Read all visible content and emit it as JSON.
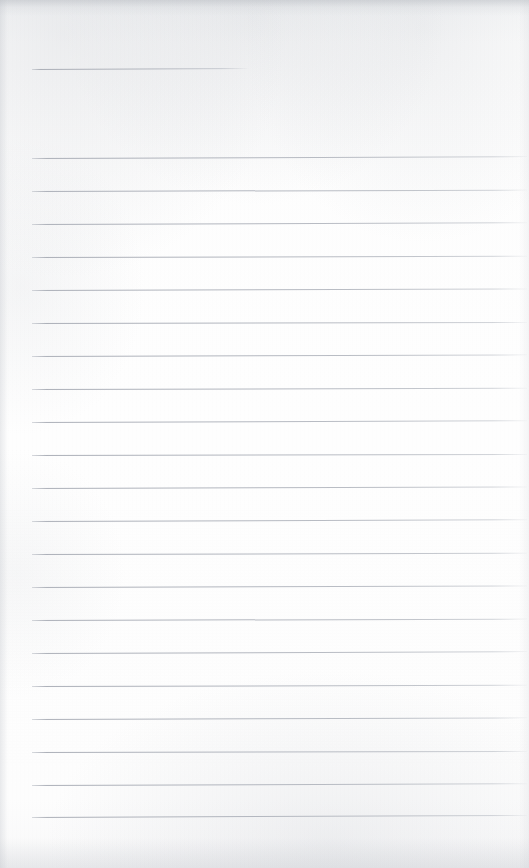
{
  "document": {
    "kind": "ruled-notebook-page",
    "title": "Blank Ruled Page",
    "content_text": "",
    "page_width": 529,
    "page_height": 868,
    "background_color": "#fdfdfd",
    "rule_color": "#aeb2bb",
    "rule_thickness_px": 1
  },
  "ruling": {
    "short_rule": {
      "label": "short-rule",
      "x_start": 32,
      "x_end": 248,
      "y": 69,
      "tilt_deg": -0.25
    },
    "body_rules": {
      "label": "body-rules",
      "count": 21,
      "x_start": 32,
      "x_end": 527,
      "first_y": 158,
      "spacing_px": 32.9,
      "lines": [
        {
          "index": 1,
          "y": 158,
          "tilt_deg": -0.22
        },
        {
          "index": 2,
          "y": 191,
          "tilt_deg": -0.16
        },
        {
          "index": 3,
          "y": 224,
          "tilt_deg": -0.2
        },
        {
          "index": 4,
          "y": 257,
          "tilt_deg": -0.14
        },
        {
          "index": 5,
          "y": 290,
          "tilt_deg": -0.18
        },
        {
          "index": 6,
          "y": 323,
          "tilt_deg": -0.12
        },
        {
          "index": 7,
          "y": 356,
          "tilt_deg": -0.19
        },
        {
          "index": 8,
          "y": 389,
          "tilt_deg": -0.15
        },
        {
          "index": 9,
          "y": 422,
          "tilt_deg": -0.21
        },
        {
          "index": 10,
          "y": 455,
          "tilt_deg": -0.13
        },
        {
          "index": 11,
          "y": 488,
          "tilt_deg": -0.17
        },
        {
          "index": 12,
          "y": 521,
          "tilt_deg": -0.2
        },
        {
          "index": 13,
          "y": 554,
          "tilt_deg": -0.14
        },
        {
          "index": 14,
          "y": 587,
          "tilt_deg": -0.18
        },
        {
          "index": 15,
          "y": 620,
          "tilt_deg": -0.16
        },
        {
          "index": 16,
          "y": 653,
          "tilt_deg": -0.22
        },
        {
          "index": 17,
          "y": 686,
          "tilt_deg": -0.15
        },
        {
          "index": 18,
          "y": 719,
          "tilt_deg": -0.19
        },
        {
          "index": 19,
          "y": 752,
          "tilt_deg": -0.13
        },
        {
          "index": 20,
          "y": 785,
          "tilt_deg": -0.2
        },
        {
          "index": 21,
          "y": 817,
          "tilt_deg": -0.24
        }
      ]
    }
  },
  "margins": {
    "left_margin_px": 32,
    "top_blank_px": 69,
    "bottom_blank_px": 51
  }
}
